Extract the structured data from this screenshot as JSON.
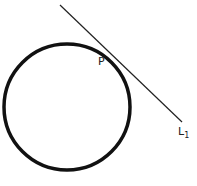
{
  "diagram": {
    "circle": {
      "cx": 67,
      "cy": 107,
      "r": 63,
      "stroke": "#111111",
      "stroke_width": 3.5
    },
    "tangent_line": {
      "x1": 60,
      "y1": 5,
      "x2": 182,
      "y2": 122,
      "stroke": "#222222",
      "stroke_width": 1.2
    },
    "labels": {
      "point": "P",
      "line_main": "L",
      "line_sub": "1"
    }
  }
}
